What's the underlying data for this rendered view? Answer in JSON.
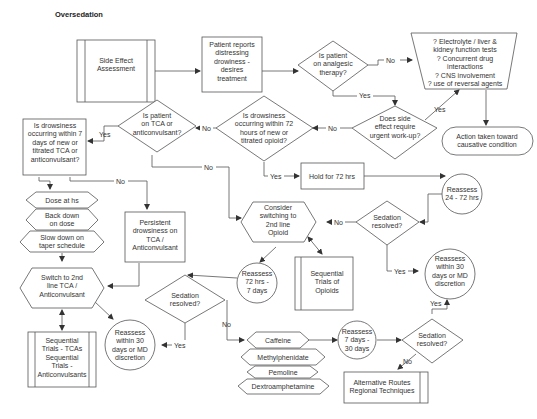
{
  "title": "Oversedation",
  "nodes": {
    "side_effect": {
      "lines": [
        "Side Effect",
        "Assessment"
      ]
    },
    "patient_reports": {
      "lines": [
        "Patient reports",
        "distressing",
        "drowiness -",
        "desires",
        "treatment"
      ]
    },
    "analgesic": {
      "lines": [
        "Is patient",
        "on analgesic",
        "therapy?"
      ]
    },
    "tests": {
      "lines": [
        "? Electrolyte / liver &",
        "kidney function tests",
        "? Concurrent drug",
        "interactions",
        "? CNS involvement",
        "? use of reversal agents"
      ]
    },
    "urgent": {
      "lines": [
        "Does side",
        "effect require",
        "urgent work-up?"
      ]
    },
    "action": {
      "lines": [
        "Action taken toward",
        "causative condition"
      ]
    },
    "drowsy72": {
      "lines": [
        "Is drowsiness",
        "occurring within 72",
        "hours of new or",
        "titrated opioid?"
      ]
    },
    "tca_q": {
      "lines": [
        "Is patient",
        "on TCA or",
        "anticonvulsant?"
      ]
    },
    "drowsy7": {
      "lines": [
        "Is drowsiness",
        "occurring within 7",
        "days of new or",
        "titrated TCA or",
        "anticonvulsant?"
      ]
    },
    "hold72": {
      "lines": [
        "Hold for 72 hrs"
      ]
    },
    "reassess_24_72": {
      "lines": [
        "Reassess",
        "24 - 72 hrs"
      ]
    },
    "sedation1": {
      "lines": [
        "Sedation",
        "resolved?"
      ]
    },
    "consider_switch": {
      "lines": [
        "Consider",
        "switching to",
        "2nd line",
        "Opioid"
      ]
    },
    "seq_opioids": {
      "lines": [
        "Sequential",
        "Trials of",
        "Opioids"
      ]
    },
    "reassess_72_7": {
      "lines": [
        "Reassess",
        "72 hrs -",
        "7 days"
      ]
    },
    "reassess_30_right": {
      "lines": [
        "Reassess",
        "within 30",
        "days or MD",
        "discretion"
      ]
    },
    "dose_hs": {
      "lines": [
        "Dose at hs"
      ]
    },
    "back_down": {
      "lines": [
        "Back down",
        "on dose"
      ]
    },
    "slow_down": {
      "lines": [
        "Slow down on",
        "taper schedule"
      ]
    },
    "persistent": {
      "lines": [
        "Persistent",
        "drowsiness on",
        "TCA /",
        "Anticonvulsant"
      ]
    },
    "switch_tca": {
      "lines": [
        "Switch to 2nd",
        "line TCA /",
        "Anticonvulsant"
      ]
    },
    "seq_tca": {
      "lines": [
        "Sequential",
        "Trials - TCAs",
        "Sequential",
        "Trials -",
        "Anticonvulsants"
      ]
    },
    "reassess_30_left": {
      "lines": [
        "Reassess",
        "within 30",
        "days or MD",
        "discretion"
      ]
    },
    "sedation2": {
      "lines": [
        "Sedation",
        "resolved?"
      ]
    },
    "caffeine": {
      "lines": [
        "Caffeine"
      ]
    },
    "methylphenidate": {
      "lines": [
        "Methylphenidate"
      ]
    },
    "pemoline": {
      "lines": [
        "Pemoline"
      ]
    },
    "dextro": {
      "lines": [
        "Dextroamphetamine"
      ]
    },
    "reassess_7_30": {
      "lines": [
        "Reassess",
        "7 days -",
        "30 days"
      ]
    },
    "sedation3": {
      "lines": [
        "Sedation",
        "resolved?"
      ]
    },
    "alt_routes": {
      "lines": [
        "Alternative Routes",
        "Regional Techniques"
      ]
    }
  },
  "edge_labels": {
    "yes": "Yes",
    "no": "No"
  },
  "colors": {
    "stroke": "#555555",
    "text": "#333333",
    "background": "#ffffff"
  }
}
